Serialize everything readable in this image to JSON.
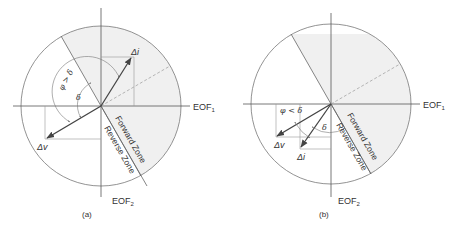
{
  "colors": {
    "line": "#555555",
    "thin": "#888888",
    "shade": "#f0f0f0",
    "vector": "#444444",
    "dashed": "#999999"
  },
  "panels": [
    {
      "caption": "(a)",
      "axis_x": "EOF",
      "axis_x_sub": "1",
      "axis_y": "EOF",
      "axis_y_sub": "2",
      "forward_zone": "Forward Zone",
      "reverse_zone": "Reverse Zone",
      "vec_current": "Δi",
      "vec_voltage": "Δv",
      "phi_label": "φ > δ",
      "delta_label": "δ"
    },
    {
      "caption": "(b)",
      "axis_x": "EOF",
      "axis_x_sub": "1",
      "axis_y": "EOF",
      "axis_y_sub": "2",
      "forward_zone": "Forward Zone",
      "reverse_zone": "Reverse Zone",
      "vec_current": "Δi",
      "vec_voltage": "Δv",
      "phi_label": "φ < δ",
      "delta_label": "δ"
    }
  ]
}
